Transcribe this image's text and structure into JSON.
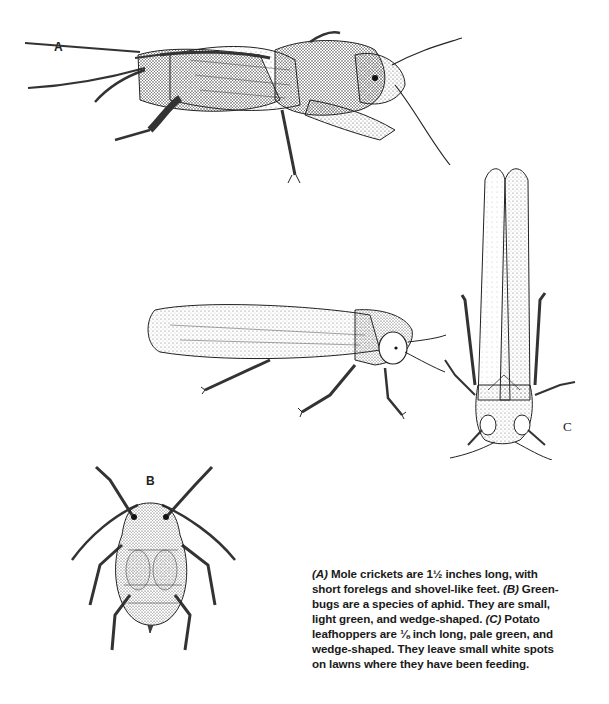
{
  "figures": {
    "a": {
      "label": "A",
      "subject": "mole-cricket"
    },
    "b": {
      "label": "B",
      "subject": "greenbug-aphid"
    },
    "c": {
      "label": "C",
      "subject": "potato-leafhopper"
    },
    "d": {
      "subject": "potato-leafhopper-side-view"
    }
  },
  "caption": {
    "lines": [
      {
        "tag": "(A)",
        "text": " Mole crickets are 1½ inches long, with"
      },
      {
        "text": "short forelegs and shovel-like feet. ",
        "tag2": "(B)",
        "text2": " Green-"
      },
      {
        "text": "bugs are a species of aphid. They are small,"
      },
      {
        "text": "light green, and wedge-shaped. ",
        "tag2": "(C)",
        "text2": " Potato"
      },
      {
        "text": "leafhoppers are ⅛ inch long, pale green, and"
      },
      {
        "text": "wedge-shaped. They leave small white spots"
      },
      {
        "text": "on lawns where they have been feeding."
      }
    ]
  },
  "colors": {
    "ink": "#1a1a1a",
    "paper": "#ffffff",
    "stipple": "#6b6b6b"
  }
}
